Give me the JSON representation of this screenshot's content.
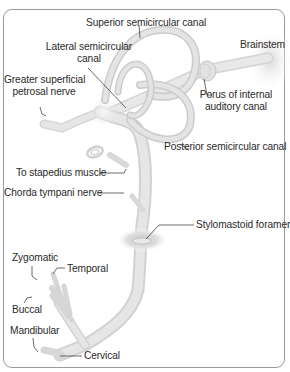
{
  "figure": {
    "colors": {
      "nerve_fill": "#e4e4e4",
      "nerve_edge": "#cfcfcf",
      "leader_line": "#444444",
      "frame": "#9a9a9a",
      "text": "#2a2a2a"
    }
  },
  "labels": {
    "superior_canal": "Superior semicircular canal",
    "lateral_canal_1": "Lateral semicircular",
    "lateral_canal_2": "canal",
    "brainstem": "Brainstem",
    "gsp_nerve_1": "Greater superficial",
    "gsp_nerve_2": "petrosal nerve",
    "porus_1": "Porus of internal",
    "porus_2": "auditory canal",
    "posterior_canal": "Posterior semicircular canal",
    "stapedius": "To stapedius muscle",
    "chorda": "Chorda tympani nerve",
    "stylomastoid": "Stylomastoid foramen",
    "zygomatic": "Zygomatic",
    "temporal": "Temporal",
    "buccal": "Buccal",
    "mandibular": "Mandibular",
    "cervical": "Cervical"
  }
}
